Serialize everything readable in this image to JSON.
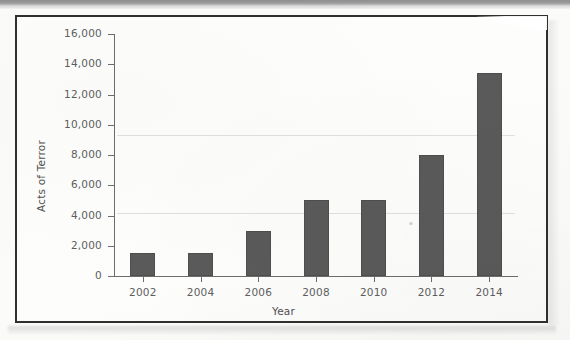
{
  "figure": {
    "frame_color": "#2f2f2f",
    "background_color": "#fdfdfc"
  },
  "chart_data": {
    "type": "bar",
    "title": "",
    "subtitle": "",
    "xlabel": "Year",
    "ylabel": "Acts of Terror",
    "categories": [
      "2002",
      "2004",
      "2006",
      "2008",
      "2010",
      "2012",
      "2014"
    ],
    "values": [
      1500,
      1500,
      3000,
      5000,
      5000,
      8000,
      13400
    ],
    "ylim": [
      0,
      16000
    ],
    "ytick_labels": [
      "0",
      "2,000",
      "4,000",
      "6,000",
      "8,000",
      "10,000",
      "12,000",
      "14,000",
      "16,000"
    ],
    "ytick_values": [
      0,
      2000,
      4000,
      6000,
      8000,
      10000,
      12000,
      14000,
      16000
    ],
    "grid": false,
    "legend": "none",
    "bar_color": "#5a5a5a",
    "axis_color": "#6d6d6d"
  }
}
